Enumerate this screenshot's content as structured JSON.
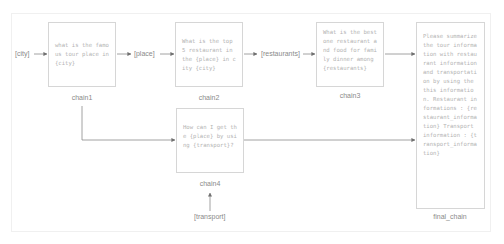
{
  "inputs": {
    "city": "[city]",
    "place": "[place]",
    "restaurants": "[restaurants]",
    "transport": "[transport]"
  },
  "chains": [
    {
      "id": "chain1",
      "label": "chain1",
      "prompt": "what is the famous tour place in {city}"
    },
    {
      "id": "chain2",
      "label": "chain2",
      "prompt": "What is the top 5 restaurant in the {place} in city {city}"
    },
    {
      "id": "chain3",
      "label": "chain3",
      "prompt": "What is the best one restaurant and food for family dinner among {restaurants}"
    },
    {
      "id": "chain4",
      "label": "chain4",
      "prompt": "How can I get the {place} by using {transport}?"
    },
    {
      "id": "final_chain",
      "label": "final_chain",
      "prompt": "Please summarize the tour information with restaurant information and transportation by using the this information. Restaurant informations : {restaurant_information} Transport information : {transport_information}"
    }
  ],
  "colors": {
    "line": "#8c8c8c",
    "box_border": "#d6d6d6",
    "text": "#b3b3b3"
  }
}
